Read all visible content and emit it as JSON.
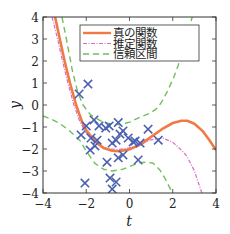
{
  "chart_data": {
    "type": "line",
    "title": "",
    "xlabel": "t",
    "ylabel": "y",
    "xlim": [
      -4,
      4
    ],
    "ylim": [
      -4,
      4
    ],
    "xticks": [
      -4,
      -2,
      0,
      2,
      4
    ],
    "yticks": [
      -4,
      -3,
      -2,
      -1,
      0,
      1,
      2,
      3,
      4
    ],
    "xtick_labels": [
      "−4",
      "−2",
      "0",
      "2",
      "4"
    ],
    "ytick_labels": [
      "−4",
      "−3",
      "−2",
      "−1",
      "0",
      "1",
      "2",
      "3",
      "4"
    ],
    "grid": false,
    "legend": {
      "placement": "top-center",
      "entries": [
        {
          "label": "真の関数",
          "color": "#f07a45",
          "style": "solid"
        },
        {
          "label": "推定関数",
          "color": "#d66fc4",
          "style": "dashdot"
        },
        {
          "label": "信頼区間",
          "color": "#6fbf5a",
          "style": "dashed"
        }
      ]
    },
    "series": [
      {
        "name": "真の関数",
        "color": "#f07a45",
        "style": "solid",
        "points": [
          [
            -3.44,
            4.0
          ],
          [
            -3.2,
            2.9
          ],
          [
            -3.0,
            2.0
          ],
          [
            -2.75,
            1.0
          ],
          [
            -2.47,
            0.0
          ],
          [
            -2.2,
            -0.75
          ],
          [
            -2.0,
            -1.15
          ],
          [
            -1.6,
            -1.65
          ],
          [
            -1.2,
            -1.95
          ],
          [
            -0.8,
            -2.08
          ],
          [
            -0.5,
            -2.1
          ],
          [
            0.0,
            -2.02
          ],
          [
            0.5,
            -1.8
          ],
          [
            1.0,
            -1.45
          ],
          [
            1.5,
            -1.1
          ],
          [
            2.0,
            -0.82
          ],
          [
            2.4,
            -0.72
          ],
          [
            2.67,
            -0.72
          ],
          [
            3.0,
            -0.85
          ],
          [
            3.4,
            -1.2
          ],
          [
            3.7,
            -1.6
          ],
          [
            4.0,
            -2.05
          ]
        ]
      },
      {
        "name": "推定関数",
        "color": "#d66fc4",
        "style": "dashdot",
        "points": [
          [
            -3.58,
            4.0
          ],
          [
            -3.3,
            2.9
          ],
          [
            -3.1,
            2.0
          ],
          [
            -2.85,
            1.0
          ],
          [
            -2.57,
            0.0
          ],
          [
            -2.3,
            -0.75
          ],
          [
            -2.05,
            -1.2
          ],
          [
            -1.7,
            -1.62
          ],
          [
            -1.3,
            -1.9
          ],
          [
            -0.9,
            -2.0
          ],
          [
            -0.5,
            -2.02
          ],
          [
            0.0,
            -1.95
          ],
          [
            0.5,
            -1.78
          ],
          [
            1.0,
            -1.58
          ],
          [
            1.55,
            -1.5
          ],
          [
            2.0,
            -1.7
          ],
          [
            2.4,
            -2.05
          ],
          [
            2.67,
            -2.35
          ],
          [
            3.0,
            -3.0
          ],
          [
            3.35,
            -4.0
          ]
        ]
      },
      {
        "name": "信頼区間(上)",
        "color": "#6fbf5a",
        "style": "dashed",
        "points": [
          [
            -3.12,
            4.0
          ],
          [
            -2.9,
            2.9
          ],
          [
            -2.65,
            1.6
          ],
          [
            -2.4,
            0.6
          ],
          [
            -2.15,
            0.0
          ],
          [
            -1.8,
            -0.45
          ],
          [
            -1.2,
            -0.8
          ],
          [
            -0.43,
            -0.9
          ],
          [
            0.0,
            -0.78
          ],
          [
            0.49,
            -0.55
          ],
          [
            1.0,
            -0.35
          ],
          [
            1.28,
            -0.14
          ],
          [
            1.5,
            0.15
          ],
          [
            1.74,
            0.6
          ],
          [
            2.0,
            1.15
          ],
          [
            2.25,
            1.8
          ],
          [
            2.6,
            2.9
          ],
          [
            2.9,
            4.0
          ]
        ]
      },
      {
        "name": "信頼区間(下)",
        "color": "#6fbf5a",
        "style": "dashed",
        "points": [
          [
            -4.0,
            -0.5
          ],
          [
            -3.6,
            -0.65
          ],
          [
            -3.2,
            -0.86
          ],
          [
            -2.8,
            -1.15
          ],
          [
            -2.3,
            -1.6
          ],
          [
            -2.0,
            -2.1
          ],
          [
            -1.6,
            -2.65
          ],
          [
            -1.2,
            -2.92
          ],
          [
            -0.8,
            -3.0
          ],
          [
            -0.3,
            -2.92
          ],
          [
            0.2,
            -2.72
          ],
          [
            0.49,
            -2.62
          ],
          [
            0.8,
            -2.6
          ],
          [
            1.1,
            -2.65
          ],
          [
            1.4,
            -2.95
          ],
          [
            1.65,
            -3.35
          ],
          [
            1.88,
            -3.8
          ],
          [
            1.95,
            -4.0
          ]
        ]
      }
    ],
    "scatter": {
      "name": "観測データ",
      "color": "#4a5fb0",
      "marker": "x",
      "points": [
        [
          -1.92,
          0.95
        ],
        [
          -2.33,
          0.5
        ],
        [
          -2.0,
          -0.95
        ],
        [
          -2.24,
          -1.36
        ],
        [
          -1.64,
          -0.68
        ],
        [
          -1.41,
          -0.95
        ],
        [
          -0.94,
          -0.95
        ],
        [
          -0.52,
          -0.8
        ],
        [
          -1.78,
          -1.5
        ],
        [
          -1.5,
          -1.6
        ],
        [
          -1.82,
          -2.05
        ],
        [
          -1.6,
          -1.86
        ],
        [
          -1.04,
          -2.6
        ],
        [
          -0.62,
          -1.6
        ],
        [
          -0.44,
          -1.32
        ],
        [
          -0.3,
          -1.18
        ],
        [
          -0.3,
          -2.27
        ],
        [
          -0.52,
          -2.4
        ],
        [
          0.17,
          -1.68
        ],
        [
          0.49,
          -1.73
        ],
        [
          0.86,
          -1.1
        ],
        [
          1.33,
          -1.6
        ],
        [
          0.4,
          -2.5
        ],
        [
          0.26,
          -1.64
        ],
        [
          -0.06,
          -1.5
        ],
        [
          -2.06,
          -3.55
        ],
        [
          -0.9,
          -3.32
        ],
        [
          -0.62,
          -3.5
        ],
        [
          -0.8,
          -3.82
        ],
        [
          -0.8,
          -1.73
        ],
        [
          -1.1,
          -1.05
        ]
      ]
    }
  }
}
